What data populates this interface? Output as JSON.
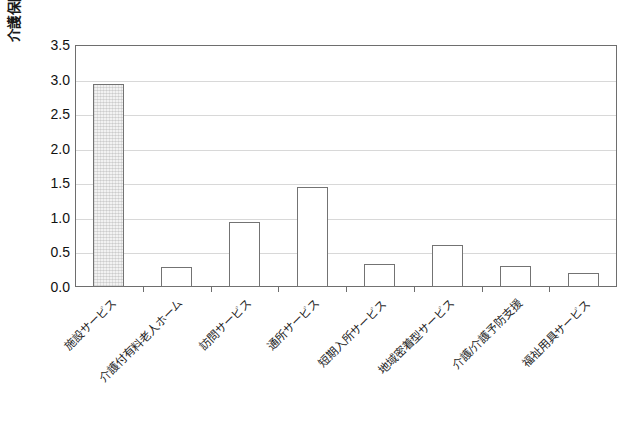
{
  "chart_data": {
    "type": "bar",
    "title": "",
    "xlabel": "",
    "ylabel": "介護保険費用（兆円）",
    "ylim": [
      0,
      3.5
    ],
    "ytick_labels": [
      "0.0",
      "0.5",
      "1.0",
      "1.5",
      "2.0",
      "2.5",
      "3.0",
      "3.5"
    ],
    "ytick_values": [
      0.0,
      0.5,
      1.0,
      1.5,
      2.0,
      2.5,
      3.0,
      3.5
    ],
    "grid": true,
    "legend": "none",
    "categories": [
      "施設サービス",
      "介護付有料老人ホーム",
      "訪問サービス",
      "通所サービス",
      "短期入所サービス",
      "地域密着型サービス",
      "介護/介護予防支援",
      "福祉用具サービス"
    ],
    "values": [
      2.93,
      0.29,
      0.94,
      1.44,
      0.33,
      0.61,
      0.31,
      0.21
    ],
    "series": [
      {
        "name": "介護保険費用",
        "values": [
          2.93,
          0.29,
          0.94,
          1.44,
          0.33,
          0.61,
          0.31,
          0.21
        ]
      }
    ],
    "bar_styles": [
      "hatched",
      "plain",
      "plain",
      "plain",
      "plain",
      "plain",
      "plain",
      "plain"
    ]
  },
  "colors": {
    "frame": "#6e6e6e",
    "gridline": "#d8d8d8",
    "bar_edge": "#737373",
    "bar_fill": "#ffffff",
    "bar_fill_hatched": "#f2f2f2",
    "text": "#111111",
    "background": "#ffffff"
  }
}
